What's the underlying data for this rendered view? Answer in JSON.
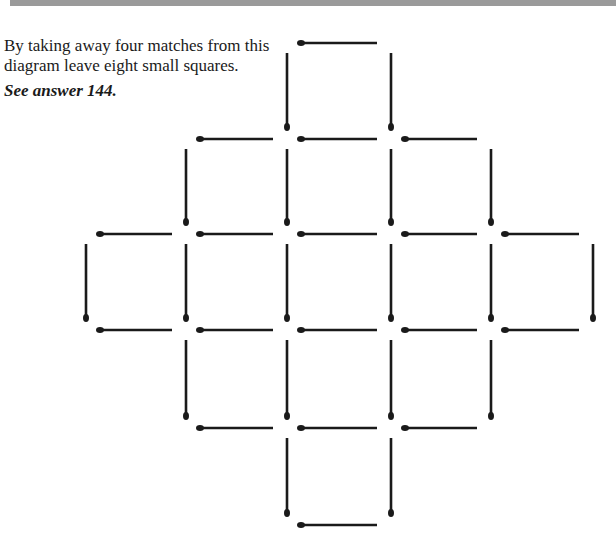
{
  "puzzle": {
    "prompt": "By taking away four matches from this diagram leave eight small squares.",
    "answer_ref": "See answer 144.",
    "colors": {
      "match": "#1a1a1a",
      "background": "#ffffff",
      "band": "#9a9a9a"
    },
    "grid": {
      "columns": 6,
      "rows": 6,
      "horizontal_matches": [
        {
          "row": 0,
          "from_col": 2
        },
        {
          "row": 1,
          "from_col": 1
        },
        {
          "row": 1,
          "from_col": 2
        },
        {
          "row": 1,
          "from_col": 3
        },
        {
          "row": 2,
          "from_col": 0
        },
        {
          "row": 2,
          "from_col": 1
        },
        {
          "row": 2,
          "from_col": 2
        },
        {
          "row": 2,
          "from_col": 3
        },
        {
          "row": 2,
          "from_col": 4
        },
        {
          "row": 3,
          "from_col": 0
        },
        {
          "row": 3,
          "from_col": 1
        },
        {
          "row": 3,
          "from_col": 2
        },
        {
          "row": 3,
          "from_col": 3
        },
        {
          "row": 3,
          "from_col": 4
        },
        {
          "row": 4,
          "from_col": 1
        },
        {
          "row": 4,
          "from_col": 2
        },
        {
          "row": 4,
          "from_col": 3
        },
        {
          "row": 5,
          "from_col": 2
        }
      ],
      "vertical_matches": [
        {
          "col": 2,
          "from_row": 0
        },
        {
          "col": 3,
          "from_row": 0
        },
        {
          "col": 1,
          "from_row": 1
        },
        {
          "col": 2,
          "from_row": 1
        },
        {
          "col": 3,
          "from_row": 1
        },
        {
          "col": 4,
          "from_row": 1
        },
        {
          "col": 0,
          "from_row": 2
        },
        {
          "col": 1,
          "from_row": 2
        },
        {
          "col": 2,
          "from_row": 2
        },
        {
          "col": 3,
          "from_row": 2
        },
        {
          "col": 4,
          "from_row": 2
        },
        {
          "col": 5,
          "from_row": 2
        },
        {
          "col": 1,
          "from_row": 3
        },
        {
          "col": 2,
          "from_row": 3
        },
        {
          "col": 3,
          "from_row": 3
        },
        {
          "col": 4,
          "from_row": 3
        },
        {
          "col": 2,
          "from_row": 4
        },
        {
          "col": 3,
          "from_row": 4
        }
      ]
    }
  }
}
